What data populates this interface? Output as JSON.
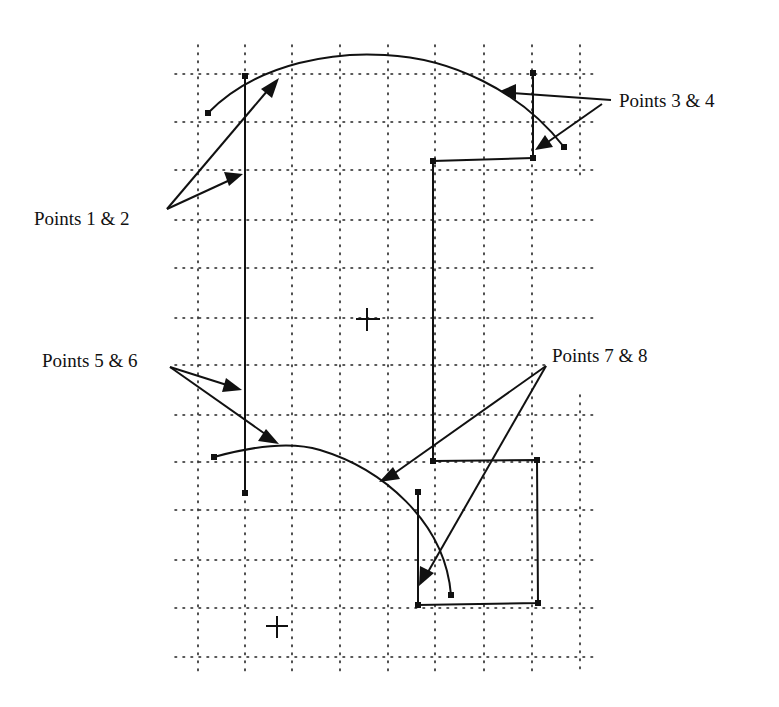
{
  "diagram": {
    "type": "bezier-control-points-grid",
    "colors": {
      "ink": "#111111",
      "background": "#ffffff"
    },
    "labels": [
      {
        "id": "points-1-2",
        "text": "Points 1 & 2",
        "x": 34,
        "y": 209
      },
      {
        "id": "points-3-4",
        "text": "Points 3 & 4",
        "x": 619,
        "y": 91
      },
      {
        "id": "points-5-6",
        "text": "Points 5 & 6",
        "x": 42,
        "y": 351
      },
      {
        "id": "points-7-8",
        "text": "Points 7 & 8",
        "x": 552,
        "y": 346
      }
    ],
    "grid": {
      "vertical_x": [
        198,
        245,
        292,
        340,
        388,
        435,
        484,
        532,
        580
      ],
      "horizontal_y": [
        74,
        122,
        170,
        220,
        268,
        318,
        365,
        415,
        462,
        510,
        560,
        608,
        657
      ],
      "x_range": [
        175,
        600
      ],
      "y_range": [
        45,
        675
      ]
    },
    "crosshairs": [
      {
        "id": "center-crosshair",
        "x": 367,
        "y": 319
      },
      {
        "id": "origin-crosshair",
        "x": 277,
        "y": 626
      }
    ]
  }
}
